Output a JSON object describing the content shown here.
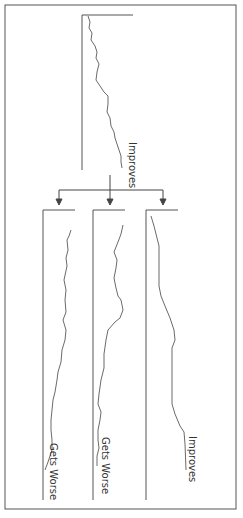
{
  "diagram": {
    "type": "outcome-branching-trend-diagram",
    "orientation": "rotated-90-clockwise",
    "colors": {
      "line": "#444444",
      "frame": "#555555",
      "text": "#333333"
    },
    "top_chart": {
      "label": "Improves"
    },
    "branches": [
      {
        "label": "Gets Worse"
      },
      {
        "label": "Gets Worse"
      },
      {
        "label": "Improves"
      }
    ]
  }
}
